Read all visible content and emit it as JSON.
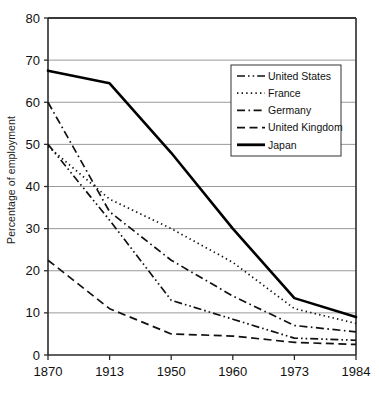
{
  "chart_data": {
    "type": "line",
    "title": "",
    "xlabel": "",
    "ylabel": "Percentage of employment",
    "categories": [
      "1870",
      "1913",
      "1950",
      "1960",
      "1973",
      "1984"
    ],
    "ylim": [
      0,
      80
    ],
    "yticks": [
      0,
      10,
      20,
      30,
      40,
      50,
      60,
      70,
      80
    ],
    "ytick_labels": [
      "0",
      "10",
      "20",
      "30",
      "40",
      "50",
      "60",
      "70",
      "80"
    ],
    "grid": "horizontal",
    "legend_position": "upper-right-inside",
    "series": [
      {
        "name": "United States",
        "style": "dash-dot-dot",
        "color": "#111111",
        "values": [
          50,
          32,
          13,
          8.5,
          4,
          3.5
        ]
      },
      {
        "name": "France",
        "style": "dotted",
        "color": "#111111",
        "values": [
          49.5,
          37,
          30,
          22,
          11,
          7.5
        ]
      },
      {
        "name": "Germany",
        "style": "dash-dot",
        "color": "#111111",
        "values": [
          60,
          34,
          22.5,
          14,
          7,
          5.5
        ]
      },
      {
        "name": "United Kingdom",
        "style": "dashed",
        "color": "#111111",
        "values": [
          22.5,
          11,
          5,
          4.5,
          3,
          2.5
        ]
      },
      {
        "name": "Japan",
        "style": "solid",
        "color": "#000000",
        "values": [
          67.5,
          64.5,
          48,
          30,
          13.5,
          9
        ]
      }
    ]
  },
  "legend": {
    "items": [
      {
        "label": "United States"
      },
      {
        "label": "France"
      },
      {
        "label": "Germany"
      },
      {
        "label": "United Kingdom"
      },
      {
        "label": "Japan"
      }
    ]
  },
  "colors": {
    "axis": "#2b2b2b",
    "grid": "#9a9a9a",
    "line": "#111111",
    "background": "#ffffff"
  }
}
